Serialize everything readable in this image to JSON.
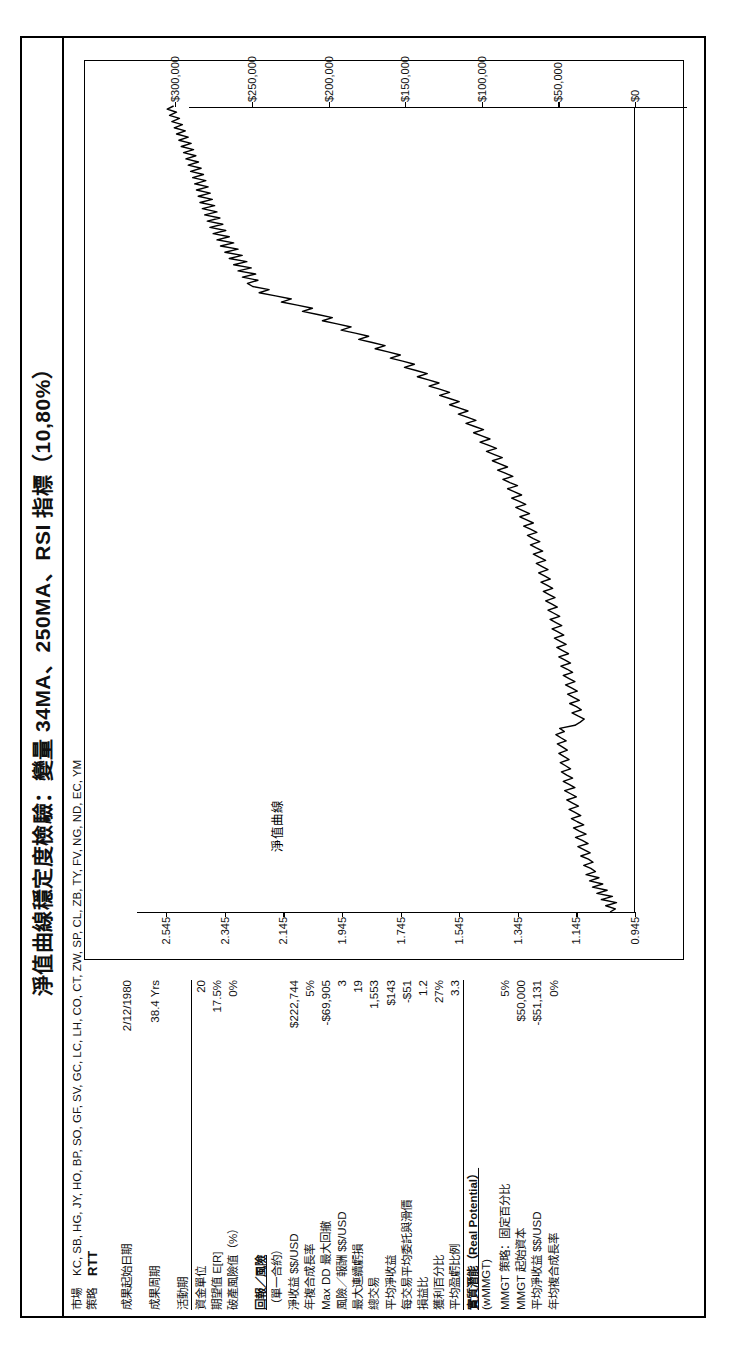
{
  "report": {
    "title": "淨值曲線穩定度檢驗：變量 34MA、250MA、RSI 指標（10,80%）"
  },
  "meta": {
    "market_label": "市場",
    "market_value": "KC, SB, HG, JY, HO, BP, SO, GF, SV, GC, LC, LH, CO, CT, ZW, SP, CL, ZB, TY, FV, NG, ND, EC, YM",
    "strategy_label": "策略",
    "strategy_value": "RTT"
  },
  "stats": [
    {
      "label": "成果起始日期",
      "value": "2/12/1980",
      "style": "plain"
    },
    {
      "label": "",
      "value": "",
      "style": "spacer"
    },
    {
      "label": "成果周期",
      "value": "38.4 Yrs",
      "style": "plain"
    },
    {
      "label": "",
      "value": "",
      "style": "spacer"
    },
    {
      "label": "活動期",
      "value": "",
      "style": "ul"
    },
    {
      "label": "資金單位",
      "value": "20",
      "style": "plain"
    },
    {
      "label": "期望值 E[R]",
      "value": "17.5%",
      "style": "plain"
    },
    {
      "label": "破產風險值（%）",
      "value": "0%",
      "style": "plain"
    },
    {
      "label": "",
      "value": "",
      "style": "spacer"
    },
    {
      "label": "回報／風險",
      "value": "",
      "style": "section"
    },
    {
      "label": "（單一合約）",
      "value": "",
      "style": "plain"
    },
    {
      "label": "淨收益 $$/USD",
      "value": "$222,744",
      "style": "plain"
    },
    {
      "label": "年複合成長率",
      "value": "5%",
      "style": "plain"
    },
    {
      "label": "Max DD 最大回撤",
      "value": "-$69,905",
      "style": "plain"
    },
    {
      "label": "風險／報酬 $$/USD",
      "value": "3",
      "style": "plain"
    },
    {
      "label": "最大連續虧損",
      "value": "19",
      "style": "plain"
    },
    {
      "label": "總交易",
      "value": "1,553",
      "style": "plain"
    },
    {
      "label": "平均淨收益",
      "value": "$143",
      "style": "plain"
    },
    {
      "label": "每交易平均委託與滑價",
      "value": "-$51",
      "style": "plain"
    },
    {
      "label": "損益比",
      "value": "1.2",
      "style": "plain"
    },
    {
      "label": "獲利百分比",
      "value": "27%",
      "style": "plain"
    },
    {
      "label": "平均盈虧比例",
      "value": "3.3",
      "style": "ul"
    },
    {
      "label": "實質潛能（Real Potential）",
      "value": "",
      "style": "section"
    },
    {
      "label": "(wMMGT)",
      "value": "",
      "style": "plain"
    },
    {
      "label": "MMGT 策略：固定百分比",
      "value": "5%",
      "style": "plain"
    },
    {
      "label": "MMGT 起始資本",
      "value": "$50,000",
      "style": "plain"
    },
    {
      "label": "平均淨收益 $$/USD",
      "value": "-$51,131",
      "style": "plain"
    },
    {
      "label": "年均複合成長率",
      "value": "0%",
      "style": "plain"
    }
  ],
  "chart_data": {
    "type": "line",
    "title": "淨值曲線",
    "xlabel": "",
    "ylabel": "",
    "grid": false,
    "legend_position": "inside-top-left",
    "y_left_ticks": [
      "0.945",
      "1.145",
      "1.345",
      "1.545",
      "1.745",
      "1.945",
      "2.145",
      "2.345",
      "2.545"
    ],
    "y_left_values": [
      0.945,
      1.145,
      1.345,
      1.545,
      1.745,
      1.945,
      2.145,
      2.345,
      2.545
    ],
    "y_right_ticks": [
      "$0",
      "$50,000",
      "$100,000",
      "$150,000",
      "$200,000",
      "$250,000",
      "$300,000"
    ],
    "y_right_values": [
      0,
      50000,
      100000,
      150000,
      200000,
      250000,
      300000
    ],
    "ylim_left": [
      0.945,
      2.645
    ],
    "ylim_right": [
      0,
      325000
    ],
    "series": [
      {
        "name": "淨值曲線",
        "values": [
          1.03,
          1.012,
          1.045,
          1.008,
          1.06,
          1.022,
          1.075,
          1.04,
          1.09,
          1.055,
          1.1,
          1.068,
          1.112,
          1.08,
          1.096,
          1.12,
          1.088,
          1.104,
          1.13,
          1.098,
          1.118,
          1.14,
          1.105,
          1.125,
          1.148,
          1.112,
          1.135,
          1.155,
          1.12,
          1.142,
          1.162,
          1.13,
          1.15,
          1.17,
          1.138,
          1.158,
          1.178,
          1.145,
          1.165,
          1.185,
          1.15,
          1.17,
          1.19,
          1.158,
          1.178,
          1.196,
          1.165,
          1.182,
          1.2,
          1.17,
          1.188,
          1.205,
          1.176,
          1.192,
          1.21,
          1.18,
          1.198,
          1.215,
          1.186,
          1.202,
          1.15,
          1.132,
          1.118,
          1.14,
          1.16,
          1.128,
          1.145,
          1.168,
          1.135,
          1.155,
          1.175,
          1.142,
          1.162,
          1.182,
          1.15,
          1.17,
          1.19,
          1.158,
          1.176,
          1.198,
          1.165,
          1.185,
          1.205,
          1.172,
          1.192,
          1.212,
          1.18,
          1.2,
          1.22,
          1.188,
          1.208,
          1.228,
          1.195,
          1.215,
          1.235,
          1.202,
          1.222,
          1.242,
          1.21,
          1.23,
          1.25,
          1.218,
          1.238,
          1.258,
          1.226,
          1.246,
          1.266,
          1.234,
          1.254,
          1.274,
          1.242,
          1.262,
          1.282,
          1.25,
          1.272,
          1.292,
          1.26,
          1.282,
          1.302,
          1.27,
          1.292,
          1.312,
          1.28,
          1.302,
          1.325,
          1.292,
          1.315,
          1.338,
          1.305,
          1.328,
          1.352,
          1.318,
          1.342,
          1.366,
          1.332,
          1.356,
          1.38,
          1.346,
          1.372,
          1.396,
          1.362,
          1.388,
          1.414,
          1.38,
          1.406,
          1.432,
          1.398,
          1.425,
          1.452,
          1.418,
          1.446,
          1.474,
          1.44,
          1.468,
          1.496,
          1.462,
          1.492,
          1.522,
          1.488,
          1.518,
          1.548,
          1.515,
          1.546,
          1.578,
          1.545,
          1.578,
          1.612,
          1.578,
          1.612,
          1.648,
          1.614,
          1.65,
          1.688,
          1.654,
          1.692,
          1.732,
          1.698,
          1.738,
          1.78,
          1.746,
          1.788,
          1.832,
          1.798,
          1.842,
          1.888,
          1.854,
          1.9,
          1.948,
          1.914,
          1.962,
          2.012,
          1.978,
          2.028,
          2.08,
          2.046,
          2.098,
          2.152,
          2.118,
          2.172,
          2.228,
          2.194,
          2.25,
          2.268,
          2.232,
          2.285,
          2.24,
          2.3,
          2.255,
          2.315,
          2.27,
          2.33,
          2.286,
          2.345,
          2.3,
          2.36,
          2.315,
          2.372,
          2.33,
          2.385,
          2.342,
          2.396,
          2.352,
          2.405,
          2.362,
          2.414,
          2.372,
          2.422,
          2.38,
          2.43,
          2.388,
          2.436,
          2.395,
          2.442,
          2.402,
          2.448,
          2.41,
          2.455,
          2.418,
          2.462,
          2.426,
          2.47,
          2.435,
          2.478,
          2.444,
          2.486,
          2.452,
          2.494,
          2.46,
          2.502,
          2.47,
          2.51,
          2.48,
          2.518,
          2.49,
          2.526,
          2.5,
          2.534,
          2.51,
          2.542,
          2.52
        ]
      }
    ]
  }
}
